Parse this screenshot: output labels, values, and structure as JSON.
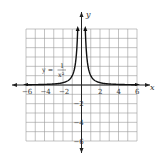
{
  "chart_data": {
    "type": "line",
    "title": "",
    "function": "y = 1/x^2",
    "equation_label": {
      "lhs": "y =",
      "numerator": "1",
      "denominator": "x²"
    },
    "xlabel": "x",
    "ylabel": "y",
    "xlim": [
      -6,
      6
    ],
    "ylim": [
      -6,
      6
    ],
    "grid": true,
    "x_ticks": [
      "-6",
      "-4",
      "-2",
      "2",
      "4",
      "6"
    ],
    "y_ticks": [
      "2",
      "4",
      "6",
      "-2",
      "-4",
      "-6"
    ],
    "visible_y_tick_labels": [
      "-2",
      "-4",
      "-6"
    ],
    "series": [
      {
        "name": "y = 1/x^2 (left branch)",
        "x": [
          -6,
          -5,
          -4,
          -3,
          -2,
          -1.5,
          -1,
          -0.75,
          -0.6,
          -0.5,
          -0.45,
          -0.41
        ],
        "y": [
          0.028,
          0.04,
          0.0625,
          0.111,
          0.25,
          0.444,
          1,
          1.778,
          2.778,
          4,
          4.94,
          5.95
        ]
      },
      {
        "name": "y = 1/x^2 (right branch)",
        "x": [
          0.41,
          0.45,
          0.5,
          0.6,
          0.75,
          1,
          1.5,
          2,
          3,
          4,
          5,
          6
        ],
        "y": [
          5.95,
          4.94,
          4,
          2.778,
          1.778,
          1,
          0.444,
          0.25,
          0.111,
          0.0625,
          0.04,
          0.028
        ]
      }
    ],
    "annotations": [
      "vertical asymptote x = 0",
      "horizontal asymptote y = 0"
    ]
  }
}
